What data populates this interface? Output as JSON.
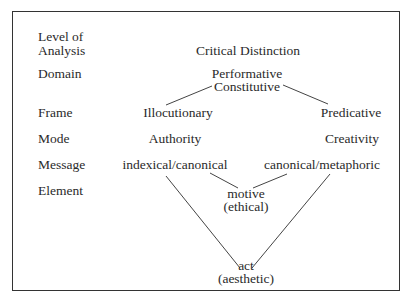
{
  "row_labels": {
    "level_line1": "Level of",
    "level_line2": "Analysis",
    "domain": "Domain",
    "frame": "Frame",
    "mode": "Mode",
    "message": "Message",
    "element": "Element"
  },
  "nodes": {
    "critical_distinction": "Critical Distinction",
    "performative": "Performative",
    "constitutive": "Constitutive",
    "illocutionary": "Illocutionary",
    "predicative": "Predicative",
    "authority": "Authority",
    "creativity": "Creativity",
    "indexical_canonical": "indexical/canonical",
    "canonical_metaphoric": "canonical/metaphoric",
    "motive": "motive",
    "ethical": "(ethical)",
    "act": "act",
    "aesthetic": "(aesthetic)"
  },
  "edges": [
    {
      "from": "constitutive",
      "to": "illocutionary"
    },
    {
      "from": "constitutive",
      "to": "predicative"
    },
    {
      "from": "indexical_canonical",
      "to": "motive"
    },
    {
      "from": "canonical_metaphoric",
      "to": "motive"
    },
    {
      "from": "indexical_canonical",
      "to": "act"
    },
    {
      "from": "canonical_metaphoric",
      "to": "act"
    }
  ]
}
